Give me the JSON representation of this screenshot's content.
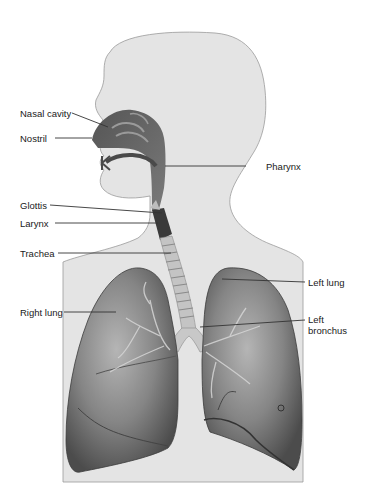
{
  "diagram": {
    "colors": {
      "background": "#ffffff",
      "body_fill": "#e4e4e4",
      "body_outline": "#9a9a9a",
      "airway_dark": "#4a4a4a",
      "lung_fill": "#6e6e6e",
      "lung_highlight": "#b8b8b8",
      "leader_line": "#333333",
      "label_text": "#1a1a1a"
    },
    "labels": {
      "nasal_cavity": "Nasal cavity",
      "nostril": "Nostril",
      "pharynx": "Pharynx",
      "glottis": "Glottis",
      "larynx": "Larynx",
      "trachea": "Trachea",
      "left_lung": "Left lung",
      "right_lung": "Right lung",
      "left_bronchus_line1": "Left",
      "left_bronchus_line2": "bronchus"
    }
  }
}
